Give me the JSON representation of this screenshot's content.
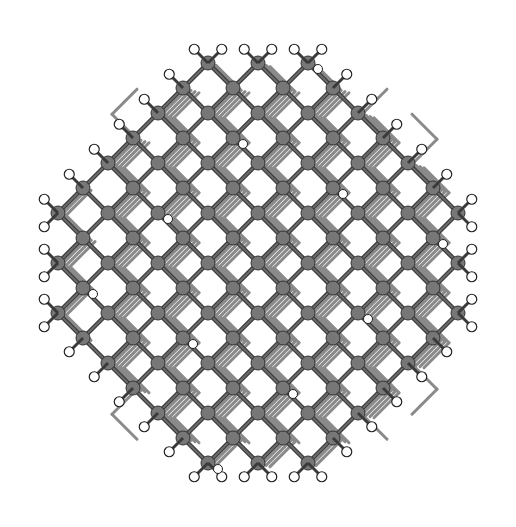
{
  "figure": {
    "center": [
      258,
      263
    ],
    "radius": 232,
    "lattice_spacing": 25,
    "layers": 4,
    "colors": {
      "background": "#ffffff",
      "bond": "#3a3a3a",
      "bond_light": "#8a8a8a",
      "core_atom": "#777777",
      "core_atom_stroke": "#333333",
      "hydrogen": "#ffffff",
      "hydrogen_stroke": "#222222"
    }
  }
}
